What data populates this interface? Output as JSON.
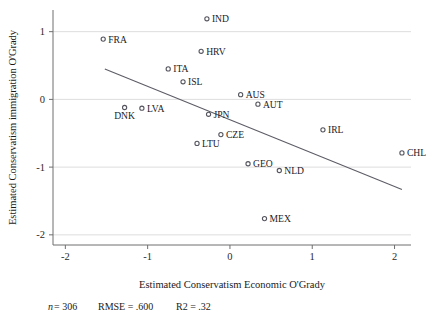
{
  "chart_data": {
    "type": "scatter",
    "title": "",
    "xlabel": "Estimated Conservatism Economic O'Grady",
    "ylabel": "Estimated Conservatism immigration O'Grady",
    "xlim": [
      -2.15,
      2.2
    ],
    "ylim": [
      -2.15,
      1.32
    ],
    "xticks": [
      -2,
      -1,
      0,
      1,
      2
    ],
    "xtick_labels": [
      "-2",
      "-1",
      "0",
      "1",
      "2"
    ],
    "yticks": [
      1,
      0,
      -1,
      -2
    ],
    "ytick_labels": [
      "1",
      "0",
      "-1",
      "-2"
    ],
    "grid": "horizontal",
    "legend": "none",
    "marker_style": "open-circle",
    "points": [
      {
        "label": "IND",
        "x": -0.28,
        "y": 1.19,
        "label_pos": "right"
      },
      {
        "label": "FRA",
        "x": -1.54,
        "y": 0.89,
        "label_pos": "right"
      },
      {
        "label": "HRV",
        "x": -0.35,
        "y": 0.71,
        "label_pos": "right"
      },
      {
        "label": "ITA",
        "x": -0.75,
        "y": 0.45,
        "label_pos": "right"
      },
      {
        "label": "ISL",
        "x": -0.57,
        "y": 0.26,
        "label_pos": "right"
      },
      {
        "label": "AUS",
        "x": 0.13,
        "y": 0.07,
        "label_pos": "right"
      },
      {
        "label": "AUT",
        "x": 0.34,
        "y": -0.07,
        "label_pos": "right"
      },
      {
        "label": "DNK",
        "x": -1.28,
        "y": -0.12,
        "label_pos": "below"
      },
      {
        "label": "LVA",
        "x": -1.07,
        "y": -0.13,
        "label_pos": "right"
      },
      {
        "label": "JPN",
        "x": -0.26,
        "y": -0.22,
        "label_pos": "right"
      },
      {
        "label": "IRL",
        "x": 1.13,
        "y": -0.45,
        "label_pos": "right"
      },
      {
        "label": "CZE",
        "x": -0.11,
        "y": -0.52,
        "label_pos": "right"
      },
      {
        "label": "LTU",
        "x": -0.4,
        "y": -0.65,
        "label_pos": "right"
      },
      {
        "label": "CHL",
        "x": 2.09,
        "y": -0.79,
        "label_pos": "right"
      },
      {
        "label": "GEO",
        "x": 0.22,
        "y": -0.95,
        "label_pos": "right"
      },
      {
        "label": "NLD",
        "x": 0.6,
        "y": -1.05,
        "label_pos": "right"
      },
      {
        "label": "MEX",
        "x": 0.42,
        "y": -1.76,
        "label_pos": "right"
      }
    ],
    "fit_line": {
      "x_start": -1.52,
      "y_start": 0.45,
      "x_end": 2.09,
      "y_end": -1.33
    }
  },
  "footnote": {
    "n_symbol": "n",
    "n_text": " = 306",
    "rmse_text": "RMSE =  .600",
    "r2_text": "R2 = .32"
  }
}
